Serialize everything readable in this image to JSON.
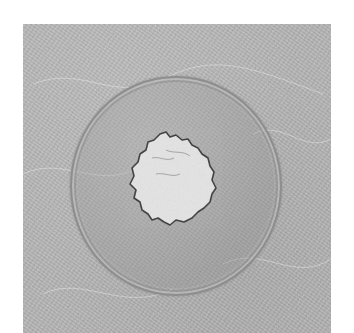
{
  "image": {
    "description": "White powder sample in a clear glass petri dish on a textured gray surface",
    "subjects": [
      "petri-dish",
      "white-powder",
      "textured-surface"
    ],
    "colors": {
      "page_background": "#ffffff",
      "surface": "#b4b4b4",
      "dish_rim": "#8e8e8e",
      "powder": "#e6e6e6",
      "powder_edge": "#3a3a3a"
    }
  }
}
